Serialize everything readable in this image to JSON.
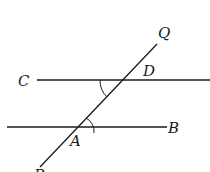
{
  "diagram": {
    "type": "geometry",
    "labels": {
      "Q": "Q",
      "C": "C",
      "D": "D",
      "A": "A",
      "B": "B",
      "P": "P"
    },
    "lines": [
      {
        "name": "CD",
        "from": "C",
        "through": "D"
      },
      {
        "name": "AB",
        "from": "A",
        "to": "B"
      },
      {
        "name": "transversal",
        "from": "P",
        "to": "Q",
        "through": [
          "A",
          "D"
        ]
      }
    ],
    "angle_marks": [
      {
        "vertex": "D",
        "between": [
          "DC",
          "DA"
        ]
      },
      {
        "vertex": "A",
        "between": [
          "AD",
          "AB"
        ]
      }
    ],
    "colors": {
      "stroke": "#1a1a1a",
      "background": "#ffffff"
    }
  }
}
